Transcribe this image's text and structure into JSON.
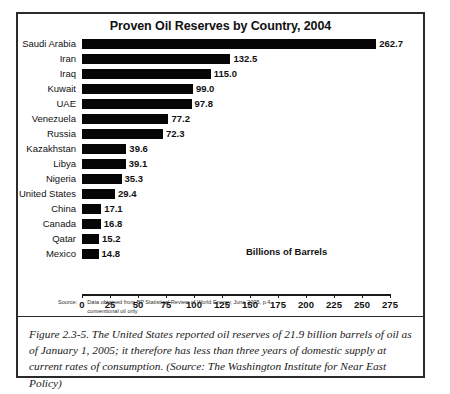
{
  "figure": {
    "caption": "Figure 2.3-5. The United States reported oil reserves of 21.9 billion barrels of oil as of January 1, 2005; it therefore has less than three years of domestic supply at current rates of consumption. (Source: The Washington Institute for Near East Policy)",
    "source_label": "Source:",
    "source_line1": "Data obtained from BP Statistical Review of World Energy, June 2005, p.4",
    "source_line2": "conventional oil only"
  },
  "chart_data": {
    "type": "bar",
    "orientation": "horizontal",
    "title": "Proven Oil Reserves by Country, 2004",
    "xlabel": "Billions of Barrels",
    "ylabel": "",
    "xlim": [
      0,
      275
    ],
    "grid": false,
    "legend": false,
    "bar_color": "#060606",
    "xticks": [
      0,
      25,
      50,
      75,
      100,
      125,
      150,
      175,
      200,
      225,
      250,
      275
    ],
    "xtick_labels": [
      "0",
      "25",
      "50",
      "75",
      "100",
      "125",
      "150",
      "175",
      "200",
      "225",
      "250",
      "275"
    ],
    "categories": [
      "Saudi Arabia",
      "Iran",
      "Iraq",
      "Kuwait",
      "UAE",
      "Venezuela",
      "Russia",
      "Kazakhstan",
      "Libya",
      "Nigeria",
      "United States",
      "China",
      "Canada",
      "Qatar",
      "Mexico"
    ],
    "values": [
      262.7,
      132.5,
      115.0,
      99.0,
      97.8,
      77.2,
      72.3,
      39.6,
      39.1,
      35.3,
      29.4,
      17.1,
      16.8,
      15.2,
      14.8
    ],
    "value_labels": [
      "262.7",
      "132.5",
      "115.0",
      "99.0",
      "97.8",
      "77.2",
      "72.3",
      "39.6",
      "39.1",
      "35.3",
      "29.4",
      "17.1",
      "16.8",
      "15.2",
      "14.8"
    ]
  }
}
